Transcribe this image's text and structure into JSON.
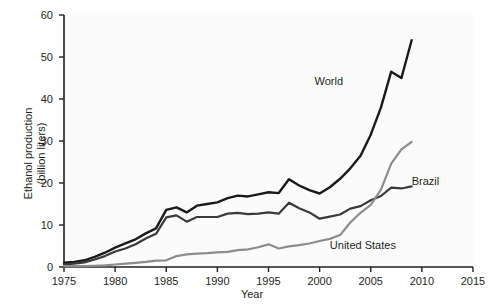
{
  "chart_data": {
    "type": "line",
    "title": "",
    "xlabel": "Year",
    "ylabel": "Ethanol production (billion liters)",
    "ylabel_line1": "Ethanol production",
    "ylabel_line2": "(billion liters)",
    "xlim": [
      1975,
      2015
    ],
    "ylim": [
      0,
      60
    ],
    "xticks": [
      1975,
      1980,
      1985,
      1990,
      1995,
      2000,
      2005,
      2010,
      2015
    ],
    "yticks": [
      0,
      10,
      20,
      30,
      40,
      50,
      60
    ],
    "grid": false,
    "legend_position": "inline-annotations",
    "x": [
      1975,
      1976,
      1977,
      1978,
      1979,
      1980,
      1981,
      1982,
      1983,
      1984,
      1985,
      1986,
      1987,
      1988,
      1989,
      1990,
      1991,
      1992,
      1993,
      1994,
      1995,
      1996,
      1997,
      1998,
      1999,
      2000,
      2001,
      2002,
      2003,
      2004,
      2005,
      2006,
      2007,
      2008,
      2009
    ],
    "series": [
      {
        "name": "World",
        "color": "#1a1a1a",
        "width": 2.4,
        "label_x": 1999.5,
        "label_y": 44.0,
        "values": [
          1.0,
          1.2,
          1.6,
          2.4,
          3.4,
          4.6,
          5.6,
          6.6,
          8.0,
          9.2,
          13.6,
          14.2,
          13.0,
          14.6,
          15.0,
          15.4,
          16.4,
          17.0,
          16.8,
          17.3,
          17.8,
          17.6,
          20.9,
          19.4,
          18.3,
          17.5,
          19.0,
          21.0,
          23.5,
          26.5,
          31.5,
          38.0,
          46.5,
          45.0,
          54.0
        ]
      },
      {
        "name": "Brazil",
        "color": "#3a3a3a",
        "width": 2.2,
        "label_x": 2009.0,
        "label_y": 20.2,
        "values": [
          0.6,
          0.8,
          1.1,
          1.8,
          2.6,
          3.7,
          4.4,
          5.4,
          6.8,
          7.9,
          11.8,
          12.3,
          10.8,
          11.9,
          11.9,
          11.9,
          12.7,
          12.9,
          12.6,
          12.7,
          13.0,
          12.7,
          15.3,
          14.0,
          13.0,
          11.5,
          12.0,
          12.5,
          13.9,
          14.5,
          15.9,
          16.9,
          18.9,
          18.7,
          19.2
        ]
      },
      {
        "name": "United States",
        "color": "#8c8c8c",
        "width": 2.2,
        "label_x": 2001.0,
        "label_y": 5.0,
        "values": [
          0.2,
          0.2,
          0.2,
          0.3,
          0.4,
          0.6,
          0.8,
          1.0,
          1.2,
          1.5,
          1.6,
          2.6,
          3.0,
          3.2,
          3.3,
          3.5,
          3.6,
          4.0,
          4.2,
          4.7,
          5.4,
          4.4,
          4.9,
          5.2,
          5.6,
          6.2,
          6.7,
          7.6,
          10.6,
          12.9,
          14.8,
          18.4,
          24.6,
          28.0,
          29.8
        ]
      }
    ]
  }
}
